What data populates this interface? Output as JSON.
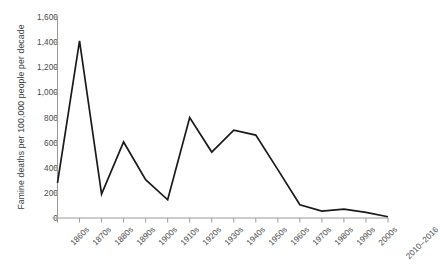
{
  "chart_data": {
    "type": "line",
    "title": "",
    "subtitle": "",
    "xlabel": "",
    "ylabel": "Famine deaths per 100,000 people per decade",
    "categories": [
      "1860s",
      "1870s",
      "1880s",
      "1890s",
      "1900s",
      "1910s",
      "1920s",
      "1930s",
      "1940s",
      "1950s",
      "1960s",
      "1970s",
      "1980s",
      "1990s",
      "2000s",
      "2010–2016"
    ],
    "values": [
      280,
      1410,
      190,
      605,
      305,
      145,
      800,
      525,
      700,
      660,
      385,
      105,
      55,
      70,
      45,
      10
    ],
    "series": [
      {
        "name": "Famine deaths per 100,000 people per decade",
        "values": [
          280,
          1410,
          190,
          605,
          305,
          145,
          800,
          525,
          700,
          660,
          385,
          105,
          55,
          70,
          45,
          10
        ]
      }
    ],
    "ylim": [
      0,
      1600
    ],
    "ytick_labels": [
      "0",
      "200",
      "400",
      "600",
      "800",
      "1,000",
      "1,200",
      "1,400",
      "1,600"
    ],
    "ytick_values": [
      0,
      200,
      400,
      600,
      800,
      1000,
      1200,
      1400,
      1600
    ],
    "grid": false,
    "legend": "none",
    "line_color": "#1a1a1a",
    "axis_color": "#9a9a9a",
    "text_color": "#4a4a4a",
    "background_color": "#ffffff"
  },
  "axis": {
    "y_title": "Famine deaths per 100,000 people per decade"
  }
}
